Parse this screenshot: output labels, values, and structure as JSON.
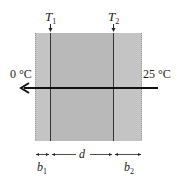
{
  "diagram": {
    "labels": {
      "t1_base": "T",
      "t1_sub": "1",
      "t2_base": "T",
      "t2_sub": "2",
      "left_temp": "0 °C",
      "right_temp": "25 °C",
      "b1_base": "b",
      "b1_sub": "1",
      "d": "d",
      "b2_base": "b",
      "b2_sub": "2"
    },
    "colors": {
      "outer_layer": "#c4c4c4",
      "inner_layer": "#b9b9b9",
      "lines": "#222222",
      "background": "#ffffff"
    },
    "heat_flow": {
      "direction": "right-to-left",
      "from": "25 °C",
      "to": "0 °C"
    }
  }
}
